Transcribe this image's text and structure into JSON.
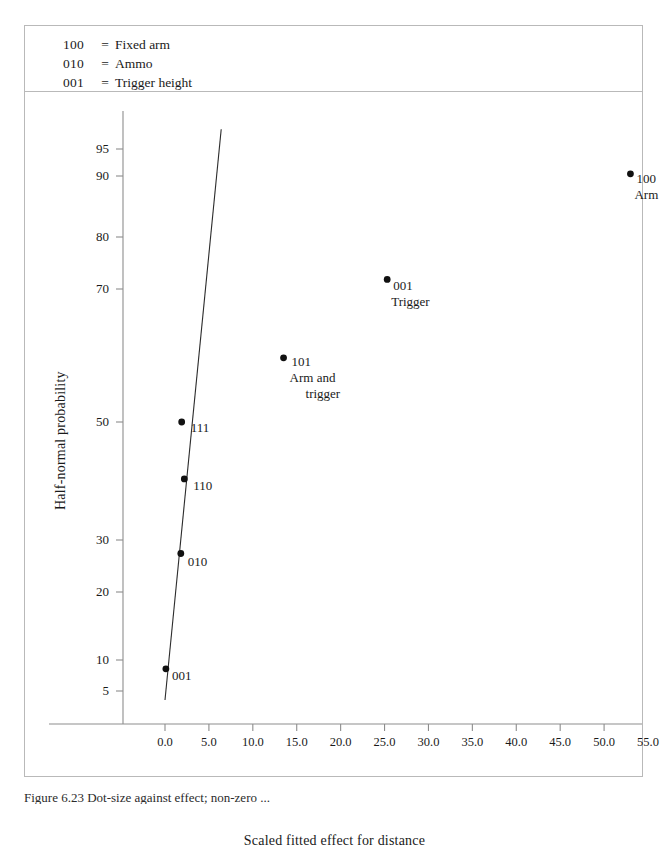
{
  "figure": {
    "caption": "Figure 6.23  Dot-size against effect; non-zero ... ",
    "legend": [
      {
        "code": "100",
        "eq": "=",
        "label": "Fixed arm"
      },
      {
        "code": "010",
        "eq": "=",
        "label": "Ammo"
      },
      {
        "code": "001",
        "eq": "=",
        "label": "Trigger height"
      }
    ]
  },
  "chart_data": {
    "type": "scatter",
    "title": "",
    "xlabel": "Scaled fitted effect for distance",
    "ylabel": "Half-normal probability",
    "xlim": [
      -2.0,
      57.5
    ],
    "ylim_probability": [
      3.0,
      97.5
    ],
    "grid": false,
    "legend_position": "top-box",
    "xticks": [
      "0.0",
      "5.0",
      "10.0",
      "15.0",
      "20.0",
      "25.0",
      "30.0",
      "35.0",
      "40.0",
      "45.0",
      "50.0",
      "55.0"
    ],
    "xtick_values": [
      0,
      5,
      10,
      15,
      20,
      25,
      30,
      35,
      40,
      45,
      50,
      55
    ],
    "yticks": [
      "95",
      "90",
      "80",
      "70",
      "50",
      "30",
      "20",
      "10",
      "5"
    ],
    "ytick_values": [
      95,
      90,
      80,
      70,
      50,
      30,
      20,
      10,
      5
    ],
    "points": [
      {
        "code": "001",
        "name": "",
        "x": 0.1,
        "prob": 8.3,
        "label_lines": [
          "001"
        ]
      },
      {
        "code": "010",
        "name": "",
        "x": 1.8,
        "prob": 27.2,
        "label_lines": [
          "010"
        ]
      },
      {
        "code": "110",
        "name": "",
        "x": 2.2,
        "prob": 40.0,
        "label_lines": [
          "110"
        ]
      },
      {
        "code": "111",
        "name": "",
        "x": 1.9,
        "prob": 50.0,
        "label_lines": [
          "111"
        ]
      },
      {
        "code": "101",
        "name": "Arm and trigger",
        "x": 13.5,
        "prob": 60.0,
        "label_lines": [
          "101",
          "Arm and",
          "trigger"
        ]
      },
      {
        "code": "001",
        "name": "Trigger",
        "x": 25.3,
        "prob": 72.0,
        "label_lines": [
          "001",
          "Trigger"
        ]
      },
      {
        "code": "100",
        "name": "Arm",
        "x": 53.0,
        "prob": 90.5,
        "label_lines": [
          "100",
          "Arm"
        ]
      }
    ],
    "fit_line": {
      "x_start": 0.0,
      "prob_start": 4.0,
      "x_end": 6.4,
      "prob_end": 97.2
    }
  }
}
